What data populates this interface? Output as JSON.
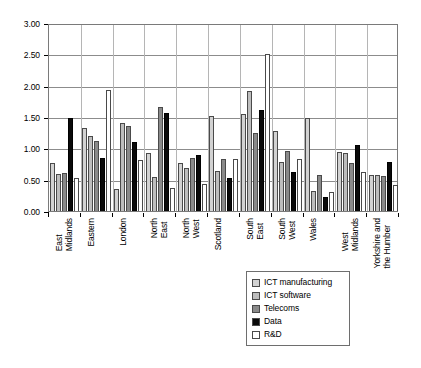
{
  "chart_data": {
    "type": "bar",
    "title": "",
    "xlabel": "",
    "ylabel": "",
    "ylim": [
      0,
      3.0
    ],
    "ytick_step": 0.5,
    "ytick_labels": [
      "3.00",
      "2.50",
      "2.00",
      "1.50",
      "1.00",
      "0.50",
      "0.00"
    ],
    "ytick_values": [
      3.0,
      2.5,
      2.0,
      1.5,
      1.0,
      0.5,
      0.0
    ],
    "grid": true,
    "legend_position": "bottom-center",
    "categories": [
      "East\nMidlands",
      "Eastern",
      "London",
      "North\nEast",
      "North\nWest",
      "Scotland",
      "South\nEast",
      "South\nWest",
      "Wales",
      "West\nMidlands",
      "Yorkshire and\nthe Humber"
    ],
    "series": [
      {
        "name": "ICT manufacturing",
        "color": "#d2d2d2",
        "values": [
          0.76,
          1.32,
          0.35,
          0.93,
          0.76,
          1.51,
          1.55,
          1.27,
          1.48,
          0.94,
          0.58
        ]
      },
      {
        "name": "ICT software",
        "color": "#bdbdbd",
        "values": [
          0.59,
          1.2,
          1.4,
          0.54,
          0.68,
          0.64,
          1.91,
          0.79,
          0.32,
          0.92,
          0.57
        ]
      },
      {
        "name": "Telecoms",
        "color": "#8a8a8a",
        "values": [
          0.6,
          1.11,
          1.36,
          1.66,
          0.84,
          0.83,
          1.25,
          0.95,
          0.58,
          0.77,
          0.56
        ]
      },
      {
        "name": "Data",
        "color": "#0a0a0a",
        "values": [
          1.49,
          0.84,
          1.1,
          1.57,
          0.9,
          0.53,
          1.61,
          0.62,
          0.22,
          1.06,
          0.79
        ]
      },
      {
        "name": "R&D",
        "color": "#ffffff",
        "values": [
          0.53,
          1.93,
          0.81,
          0.37,
          0.43,
          0.83,
          2.5,
          0.83,
          0.31,
          0.63,
          0.41
        ]
      }
    ]
  },
  "legend": {
    "items": [
      {
        "label": "ICT manufacturing",
        "swatch": "legend-swatch-ict-manufacturing"
      },
      {
        "label": "ICT software",
        "swatch": "legend-swatch-ict-software"
      },
      {
        "label": "Telecoms",
        "swatch": "legend-swatch-telecoms"
      },
      {
        "label": "Data",
        "swatch": "legend-swatch-data"
      },
      {
        "label": "R&D",
        "swatch": "legend-swatch-rd"
      }
    ]
  }
}
